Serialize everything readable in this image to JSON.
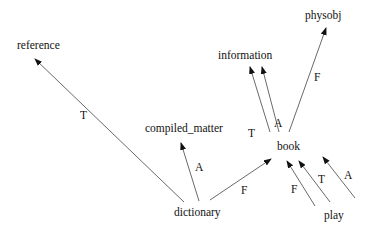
{
  "diagram": {
    "type": "directed-graph",
    "nodes": [
      {
        "id": "reference",
        "label": "reference"
      },
      {
        "id": "compiled_matter",
        "label": "compiled_matter"
      },
      {
        "id": "information",
        "label": "information"
      },
      {
        "id": "physobj",
        "label": "physobj"
      },
      {
        "id": "book",
        "label": "book"
      },
      {
        "id": "dictionary",
        "label": "dictionary"
      },
      {
        "id": "play",
        "label": "play"
      }
    ],
    "edges": [
      {
        "from": "dictionary",
        "to": "reference",
        "label": "T"
      },
      {
        "from": "dictionary",
        "to": "compiled_matter",
        "label": "A"
      },
      {
        "from": "dictionary",
        "to": "book",
        "label": "F"
      },
      {
        "from": "book",
        "to": "information",
        "label": "T"
      },
      {
        "from": "book",
        "to": "information",
        "label": "A"
      },
      {
        "from": "book",
        "to": "physobj",
        "label": "F"
      },
      {
        "from": "play",
        "to": "book",
        "label": "F"
      },
      {
        "from": "play",
        "to": "book",
        "label": "T"
      },
      {
        "from": "play",
        "to": "book",
        "label": "A"
      }
    ]
  }
}
